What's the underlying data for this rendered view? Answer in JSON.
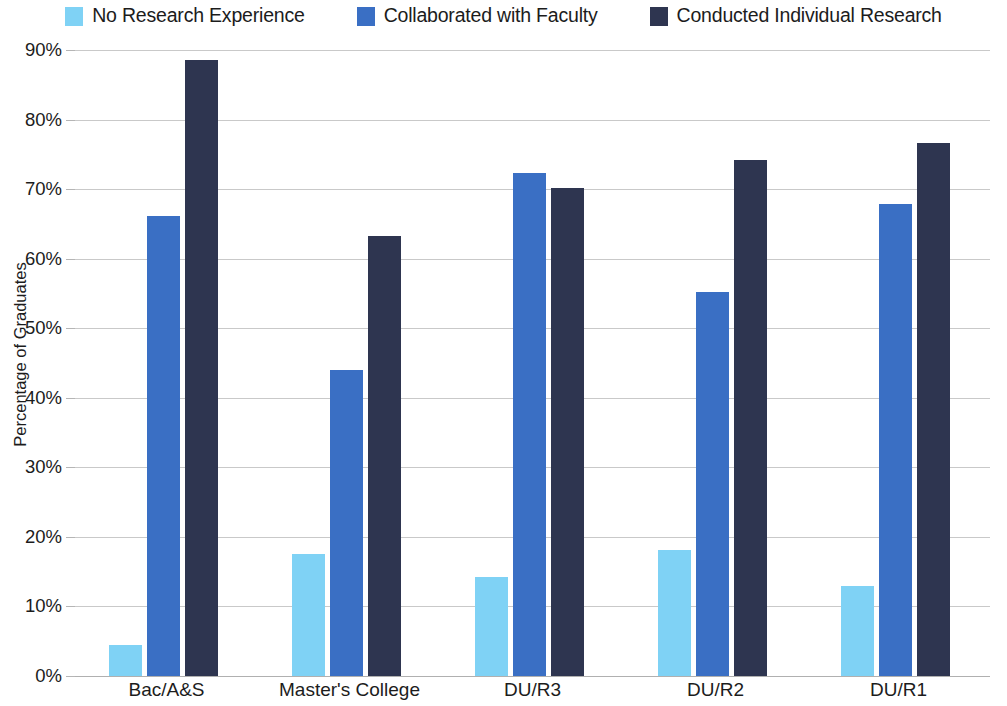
{
  "chart_data": {
    "type": "bar",
    "title": "",
    "subtitle": "",
    "xlabel": "",
    "ylabel": "Percentage of Graduates",
    "categories": [
      "Bac/A&S",
      "Master's College",
      "DU/R3",
      "DU/R2",
      "DU/R1"
    ],
    "series": [
      {
        "name": "No Research Experience",
        "color": "#7FD2F5",
        "values": [
          4.4,
          17.6,
          14.2,
          18.1,
          13.0
        ]
      },
      {
        "name": "Collaborated with Faculty",
        "color": "#3A6FC4",
        "values": [
          66.1,
          44.0,
          72.3,
          55.2,
          67.8
        ]
      },
      {
        "name": "Conducted Individual Research",
        "color": "#2E3550",
        "values": [
          88.5,
          63.3,
          70.1,
          74.2,
          76.6
        ]
      }
    ],
    "ylim": [
      0,
      90
    ],
    "ytick_values": [
      0,
      10,
      20,
      30,
      40,
      50,
      60,
      70,
      80,
      90
    ],
    "ytick_labels": [
      "0%",
      "10%",
      "20%",
      "30%",
      "40%",
      "50%",
      "60%",
      "70%",
      "80%",
      "90%"
    ],
    "grid": true,
    "legend_position": "top",
    "value_suffix": "%"
  }
}
